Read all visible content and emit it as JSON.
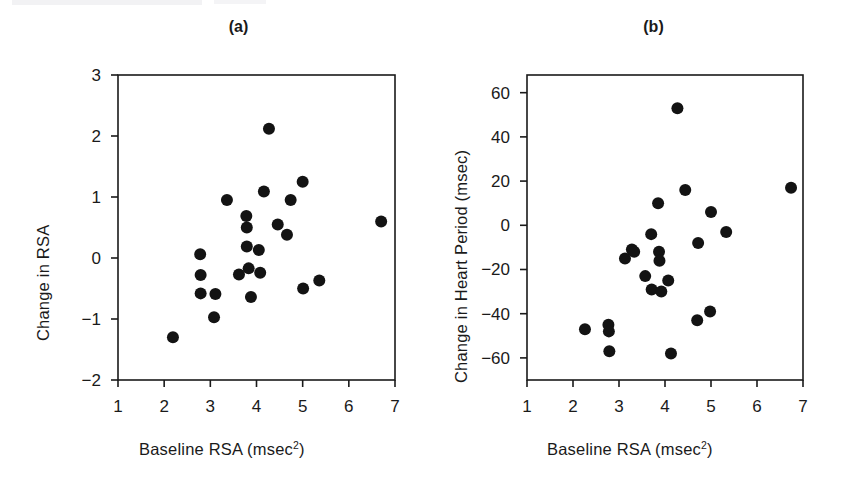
{
  "figure": {
    "background": "#ffffff",
    "marker_color": "#131313",
    "axis_color": "#1a1a1a"
  },
  "panels": [
    {
      "key": "a",
      "title": "(a)",
      "xlabel_text": "Baseline RSA (msec",
      "xlabel_sup": "2",
      "xlabel_tail": ")",
      "ylabel": "Change in RSA",
      "xticks": [
        "1",
        "2",
        "3",
        "4",
        "5",
        "6",
        "7"
      ],
      "yticks": [
        "3",
        "2",
        "1",
        "0",
        "−1",
        "−2"
      ]
    },
    {
      "key": "b",
      "title": "(b)",
      "xlabel_text": "Baseline RSA (msec",
      "xlabel_sup": "2",
      "xlabel_tail": ")",
      "ylabel": "Change in Heart Period (msec)",
      "xticks": [
        "1",
        "2",
        "3",
        "4",
        "5",
        "6",
        "7"
      ],
      "yticks": [
        "60",
        "40",
        "20",
        "0",
        "−20",
        "−40",
        "−60"
      ]
    }
  ],
  "chart_data": [
    {
      "type": "scatter",
      "panel": "a",
      "title": "(a)",
      "xlabel": "Baseline RSA (msec2)",
      "ylabel": "Change in RSA",
      "xlim": [
        1,
        7
      ],
      "ylim": [
        -2,
        3
      ],
      "xticks": [
        1,
        2,
        3,
        4,
        5,
        6,
        7
      ],
      "yticks": [
        -2,
        -1,
        0,
        1,
        2,
        3
      ],
      "grid": false,
      "legend": null,
      "points": [
        {
          "x": 2.19,
          "y": -1.3
        },
        {
          "x": 2.78,
          "y": 0.06
        },
        {
          "x": 2.79,
          "y": -0.28
        },
        {
          "x": 2.79,
          "y": -0.58
        },
        {
          "x": 3.08,
          "y": -0.97
        },
        {
          "x": 3.11,
          "y": -0.59
        },
        {
          "x": 3.36,
          "y": 0.95
        },
        {
          "x": 3.62,
          "y": -0.27
        },
        {
          "x": 3.78,
          "y": 0.69
        },
        {
          "x": 3.79,
          "y": 0.5
        },
        {
          "x": 3.79,
          "y": 0.19
        },
        {
          "x": 3.83,
          "y": -0.17
        },
        {
          "x": 3.88,
          "y": -0.64
        },
        {
          "x": 4.05,
          "y": 0.13
        },
        {
          "x": 4.08,
          "y": -0.24
        },
        {
          "x": 4.16,
          "y": 1.09
        },
        {
          "x": 4.27,
          "y": 2.12
        },
        {
          "x": 4.46,
          "y": 0.55
        },
        {
          "x": 4.66,
          "y": 0.38
        },
        {
          "x": 4.74,
          "y": 0.95
        },
        {
          "x": 5.0,
          "y": 1.25
        },
        {
          "x": 5.01,
          "y": -0.5
        },
        {
          "x": 5.36,
          "y": -0.37
        },
        {
          "x": 6.7,
          "y": 0.6
        }
      ]
    },
    {
      "type": "scatter",
      "panel": "b",
      "title": "(b)",
      "xlabel": "Baseline RSA (msec2)",
      "ylabel": "Change in Heart Period (msec)",
      "xlim": [
        1,
        7
      ],
      "ylim": [
        -70,
        68
      ],
      "xticks": [
        1,
        2,
        3,
        4,
        5,
        6,
        7
      ],
      "yticks": [
        -60,
        -40,
        -20,
        0,
        20,
        40,
        60
      ],
      "grid": false,
      "legend": null,
      "points": [
        {
          "x": 2.26,
          "y": -47
        },
        {
          "x": 2.77,
          "y": -45
        },
        {
          "x": 2.78,
          "y": -48
        },
        {
          "x": 2.79,
          "y": -57
        },
        {
          "x": 3.13,
          "y": -15
        },
        {
          "x": 3.28,
          "y": -11
        },
        {
          "x": 3.33,
          "y": -12
        },
        {
          "x": 3.57,
          "y": -23
        },
        {
          "x": 3.7,
          "y": -4
        },
        {
          "x": 3.71,
          "y": -29
        },
        {
          "x": 3.85,
          "y": 10
        },
        {
          "x": 3.87,
          "y": -12
        },
        {
          "x": 3.88,
          "y": -16
        },
        {
          "x": 3.92,
          "y": -30
        },
        {
          "x": 4.07,
          "y": -25
        },
        {
          "x": 4.13,
          "y": -58
        },
        {
          "x": 4.27,
          "y": 53
        },
        {
          "x": 4.44,
          "y": 16
        },
        {
          "x": 4.7,
          "y": -43
        },
        {
          "x": 4.72,
          "y": -8
        },
        {
          "x": 4.98,
          "y": -39
        },
        {
          "x": 5.0,
          "y": 6
        },
        {
          "x": 5.33,
          "y": -3
        },
        {
          "x": 6.74,
          "y": 17
        }
      ]
    }
  ]
}
